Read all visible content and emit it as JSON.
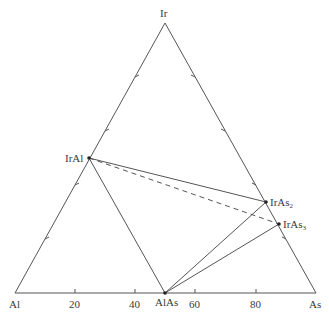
{
  "diagram": {
    "type": "ternary-phase-diagram",
    "vertices": {
      "top": "Ir",
      "bottom_left": "Al",
      "bottom_right": "As"
    },
    "base_axis_ticks": [
      "20",
      "40",
      "60",
      "80"
    ],
    "phases": [
      {
        "name": "IrAl",
        "base": "IrAl",
        "sub": ""
      },
      {
        "name": "IrAs2",
        "base": "IrAs",
        "sub": "2"
      },
      {
        "name": "IrAs3",
        "base": "IrAs",
        "sub": "3"
      },
      {
        "name": "AlAs",
        "base": "AlAs",
        "sub": ""
      }
    ],
    "tie_lines": [
      {
        "from": "IrAl",
        "to": "IrAs2",
        "style": "solid"
      },
      {
        "from": "IrAl",
        "to": "AlAs",
        "style": "solid"
      },
      {
        "from": "IrAl",
        "to": "IrAs3",
        "style": "dashed"
      },
      {
        "from": "AlAs",
        "to": "IrAs2",
        "style": "solid"
      },
      {
        "from": "AlAs",
        "to": "IrAs3",
        "style": "solid"
      }
    ],
    "colors": {
      "line": "#555555",
      "point": "#222222",
      "text": "#3a3a3a"
    }
  }
}
